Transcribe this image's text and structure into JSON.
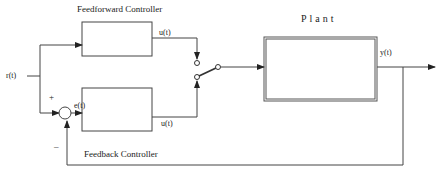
{
  "diagram": {
    "type": "block-diagram",
    "blocks": {
      "feedforward": {
        "label": "Feedforward Controller"
      },
      "feedback": {
        "label": "Feedback Controller"
      },
      "plant": {
        "label": "Plant"
      }
    },
    "signals": {
      "reference": "r(t)",
      "error": "e(t)",
      "feedforward_output": "u(t)",
      "feedback_output": "u(t)",
      "plant_output": "y(t)"
    },
    "summing_junction": {
      "plus_sign": "+",
      "minus_sign": "–"
    },
    "switch": {
      "type": "two-position selector"
    },
    "colors": {
      "line": "#333333",
      "background": "#ffffff"
    }
  }
}
